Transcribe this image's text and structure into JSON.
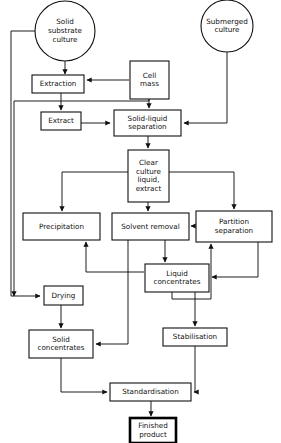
{
  "diagram": {
    "background_color": "#ffffff",
    "line_color": "#111111",
    "nodes": [
      {
        "id": "solid_substrate_culture",
        "shape": "circle",
        "label_lines": [
          "Solid",
          "substrate",
          "culture"
        ],
        "cx": 65,
        "cy": 31,
        "r": 30
      },
      {
        "id": "submerged_culture",
        "shape": "circle",
        "label_lines": [
          "Submerged",
          "culture"
        ],
        "cx": 227,
        "cy": 26,
        "r": 26
      },
      {
        "id": "extraction",
        "shape": "rect",
        "label_lines": [
          "Extraction"
        ],
        "x": 32,
        "y": 75,
        "w": 52,
        "h": 18
      },
      {
        "id": "cell_mass",
        "shape": "rect",
        "label_lines": [
          "Cell",
          "mass"
        ],
        "x": 130,
        "y": 61,
        "w": 39,
        "h": 38
      },
      {
        "id": "extract",
        "shape": "rect",
        "label_lines": [
          "Extract"
        ],
        "x": 41,
        "y": 112,
        "w": 40,
        "h": 18
      },
      {
        "id": "solid_liquid_separation",
        "shape": "rect",
        "label_lines": [
          "Solid-liquid",
          "separation"
        ],
        "x": 114,
        "y": 110,
        "w": 67,
        "h": 26
      },
      {
        "id": "clear_culture_liquid_extract",
        "shape": "rect",
        "label_lines": [
          "Clear",
          "culture",
          "liquid,",
          "extract"
        ],
        "x": 128,
        "y": 150,
        "w": 41,
        "h": 52
      },
      {
        "id": "precipitation",
        "shape": "rect",
        "label_lines": [
          "Precipitation"
        ],
        "x": 23,
        "y": 213,
        "w": 77,
        "h": 27
      },
      {
        "id": "solvent_removal",
        "shape": "rect",
        "label_lines": [
          "Solvent removal"
        ],
        "x": 112,
        "y": 213,
        "w": 77,
        "h": 27
      },
      {
        "id": "partition_separation",
        "shape": "rect",
        "label_lines": [
          "Partition",
          "separation"
        ],
        "x": 196,
        "y": 211,
        "w": 76,
        "h": 31
      },
      {
        "id": "liquid_concentrates",
        "shape": "rect",
        "label_lines": [
          "Liquid",
          "concentrates"
        ],
        "x": 145,
        "y": 264,
        "w": 64,
        "h": 28
      },
      {
        "id": "drying",
        "shape": "rect",
        "label_lines": [
          "Drying"
        ],
        "x": 44,
        "y": 286,
        "w": 39,
        "h": 19
      },
      {
        "id": "solid_concentrates",
        "shape": "rect",
        "label_lines": [
          "Solid",
          "concentrates"
        ],
        "x": 29,
        "y": 330,
        "w": 64,
        "h": 28
      },
      {
        "id": "stabilisation",
        "shape": "rect",
        "label_lines": [
          "Stabilisation"
        ],
        "x": 163,
        "y": 328,
        "w": 64,
        "h": 18
      },
      {
        "id": "standardisation",
        "shape": "rect",
        "label_lines": [
          "Standardisation"
        ],
        "x": 110,
        "y": 383,
        "w": 81,
        "h": 18
      },
      {
        "id": "finished_product",
        "shape": "rect-bold",
        "label_lines": [
          "Finished",
          "product"
        ],
        "x": 130,
        "y": 418,
        "w": 46,
        "h": 25
      }
    ],
    "edges": [
      {
        "from": "solid_substrate_culture",
        "to": "extraction",
        "path": "M65,61 L65,74"
      },
      {
        "from": "solid_substrate_culture",
        "to": "drying",
        "path": "M37,31 L11,31 L11,296 L40,296"
      },
      {
        "from": "submerged_culture",
        "to": "solid_liquid_separation",
        "path": "M227,52 L227,123 L184,123"
      },
      {
        "from": "cell_mass",
        "to": "extraction",
        "path": "M129,80 L87,80"
      },
      {
        "from": "cell_mass",
        "to": "solid_liquid_separation",
        "path": "M149,99 L149,108"
      },
      {
        "from": "cell_mass",
        "to": "extract_branch",
        "path": "M149,99 L149,101 L14,101 L14,296"
      },
      {
        "from": "extraction",
        "to": "extract",
        "path": "M61,93 L61,110"
      },
      {
        "from": "extract",
        "to": "solid_liquid_separation",
        "path": "M81,123 L110,123"
      },
      {
        "from": "solid_liquid_separation",
        "to": "clear_culture_liquid_extract",
        "path": "M148,136 L148,148"
      },
      {
        "from": "clear_culture_liquid_extract",
        "to": "precipitation",
        "path": "M128,172 L62,172 L62,211"
      },
      {
        "from": "clear_culture_liquid_extract",
        "to": "solvent_removal",
        "path": "M148,202 L148,211"
      },
      {
        "from": "clear_culture_liquid_extract",
        "to": "partition_separation",
        "path": "M169,172 L234,172 L234,209"
      },
      {
        "from": "partition_separation",
        "to": "solvent_removal",
        "path": "M195,226 L191,226"
      },
      {
        "from": "solvent_removal",
        "to": "liquid_concentrates",
        "path": "M165,240 L165,262"
      },
      {
        "from": "liquid_concentrates",
        "to": "precipitation",
        "path": "M144,272 L86,272 L86,242"
      },
      {
        "from": "liquid_concentrates",
        "to": "partition_separation",
        "path": "M172,292 L172,299 L211,299 L211,244"
      },
      {
        "from": "partition_separation",
        "to": "liquid_concentrates",
        "path": "M258,242 L258,277 L212,277"
      },
      {
        "from": "solvent_removal",
        "to": "solid_concentrates",
        "path": "M128,240 L128,344 L96,344"
      },
      {
        "from": "drying",
        "to": "solid_concentrates",
        "path": "M61,305 L61,328"
      },
      {
        "from": "liquid_concentrates",
        "to": "stabilisation",
        "path": "M195,292 L195,326"
      },
      {
        "from": "solid_concentrates",
        "to": "standardisation",
        "path": "M61,358 L61,392 L107,392"
      },
      {
        "from": "stabilisation",
        "to": "standardisation",
        "path": "M195,346 L195,392 L194,392"
      },
      {
        "from": "standardisation",
        "to": "finished_product",
        "path": "M151,401 L151,416"
      }
    ]
  }
}
